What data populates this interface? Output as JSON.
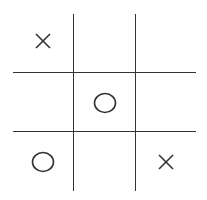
{
  "game": "tic-tac-toe",
  "board": [
    [
      "X",
      "",
      ""
    ],
    [
      "",
      "O",
      ""
    ],
    [
      "O",
      "",
      "X"
    ]
  ],
  "colors": {
    "line": "#333333",
    "mark": "#333333",
    "background": "#ffffff"
  }
}
